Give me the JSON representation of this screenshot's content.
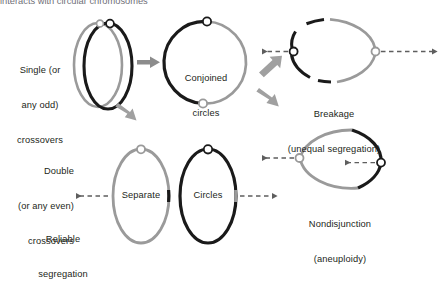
{
  "figure": {
    "cropped_header": "interacts with circular chromosomes",
    "colors": {
      "black": "#1a1a1a",
      "gray": "#9a9a9a",
      "arrow_gray": "#8c8c8c",
      "dash_gray": "#6e6e6e",
      "text": "#231f20",
      "node_fill": "#ffffff"
    }
  },
  "panels": {
    "single_crossover": {
      "label_lines": [
        "Single (or",
        "any odd)",
        "crossovers"
      ],
      "icon": "interlocked-circles"
    },
    "conjoined": {
      "label_lines": [
        "Conjoined",
        "circles"
      ],
      "icon": "single-fused-circle"
    },
    "breakage": {
      "label_lines": [
        "Breakage",
        "(unequal segregation)"
      ],
      "icon": "broken-circle"
    },
    "double_crossover": {
      "label_lines": [
        "Double",
        "(or any even)",
        "crossovers"
      ],
      "icon": "two-separate-circles"
    },
    "separate": {
      "label": "Separate"
    },
    "circles": {
      "label": "Circles"
    },
    "reliable": {
      "label_lines": [
        "Reliable",
        "segregation"
      ]
    },
    "nondisjunction": {
      "label_lines": [
        "Nondisjunction",
        "(aneuploidy)"
      ],
      "icon": "circle-pulled-one-way"
    }
  },
  "arrows": {
    "to_conjoined": "arrow-right-solid-gray",
    "to_double": "arrow-down-right-solid-gray",
    "to_breakage": "arrow-up-right-solid-gray",
    "to_nondisjunction": "arrow-down-right-solid-gray",
    "breakage_left": "dashed-arrow-left",
    "breakage_right": "dashed-arrow-right",
    "separate_left": "dashed-arrow-left",
    "circles_right": "dashed-arrow-right",
    "nondisjunction_outer": "dashed-arrow-left",
    "nondisjunction_inner": "dashed-arrow-left"
  }
}
